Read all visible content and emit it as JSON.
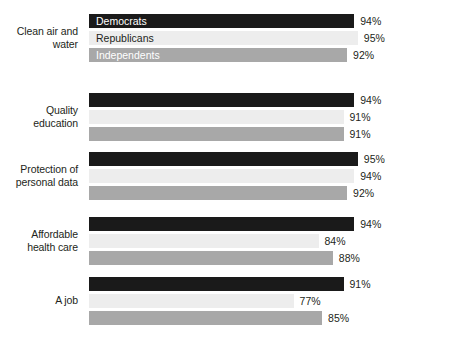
{
  "chart_data": {
    "type": "bar",
    "orientation": "horizontal",
    "title": "",
    "subtitle": "",
    "xlabel": "",
    "ylabel": "",
    "grid": false,
    "legend_position": "inside-first-group-bars",
    "value_suffix": "%",
    "axis_origin_percent": 62,
    "axis_max_percent": 100,
    "categories": [
      "Clean air and water",
      "Quality education",
      "Protection of personal data",
      "Affordable health care",
      "A job"
    ],
    "category_lines": [
      [
        "Clean air and",
        "water"
      ],
      [
        "Quality",
        "education"
      ],
      [
        "Protection of",
        "personal data"
      ],
      [
        "Affordable",
        "health care"
      ],
      [
        "A job"
      ]
    ],
    "series": [
      {
        "name": "Democrats",
        "color": "#1a1a1a",
        "values": [
          94,
          94,
          95,
          94,
          91
        ],
        "labels": [
          "94%",
          "94%",
          "95%",
          "94%",
          "91%"
        ]
      },
      {
        "name": "Republicans",
        "color": "#ededed",
        "values": [
          95,
          91,
          94,
          84,
          77
        ],
        "labels": [
          "95%",
          "91%",
          "94%",
          "84%",
          "77%"
        ]
      },
      {
        "name": "Independents",
        "color": "#a8a8a8",
        "values": [
          92,
          91,
          92,
          88,
          85
        ],
        "labels": [
          "92%",
          "91%",
          "92%",
          "88%",
          "85%"
        ]
      }
    ]
  },
  "legend": {
    "items": [
      {
        "label": "Democrats",
        "color": "#1a1a1a"
      },
      {
        "label": "Republicans",
        "color": "#ededed"
      },
      {
        "label": "Independents",
        "color": "#a8a8a8"
      }
    ]
  },
  "groups": [
    {
      "label_lines": [
        "Clean air and",
        "water"
      ],
      "bars": [
        {
          "series": "Democrats",
          "value": 94,
          "label": "94%"
        },
        {
          "series": "Republicans",
          "value": 95,
          "label": "95%"
        },
        {
          "series": "Independents",
          "value": 92,
          "label": "92%"
        }
      ]
    },
    {
      "label_lines": [
        "Quality",
        "education"
      ],
      "bars": [
        {
          "series": "Democrats",
          "value": 94,
          "label": "94%"
        },
        {
          "series": "Republicans",
          "value": 91,
          "label": "91%"
        },
        {
          "series": "Independents",
          "value": 91,
          "label": "91%"
        }
      ]
    },
    {
      "label_lines": [
        "Protection of",
        "personal data"
      ],
      "bars": [
        {
          "series": "Democrats",
          "value": 95,
          "label": "95%"
        },
        {
          "series": "Republicans",
          "value": 94,
          "label": "94%"
        },
        {
          "series": "Independents",
          "value": 92,
          "label": "92%"
        }
      ]
    },
    {
      "label_lines": [
        "Affordable",
        "health care"
      ],
      "bars": [
        {
          "series": "Democrats",
          "value": 94,
          "label": "94%"
        },
        {
          "series": "Republicans",
          "value": 84,
          "label": "84%"
        },
        {
          "series": "Independents",
          "value": 88,
          "label": "88%"
        }
      ]
    },
    {
      "label_lines": [
        "A job"
      ],
      "bars": [
        {
          "series": "Democrats",
          "value": 91,
          "label": "91%"
        },
        {
          "series": "Republicans",
          "value": 77,
          "label": "77%"
        },
        {
          "series": "Independents",
          "value": 85,
          "label": "85%"
        }
      ]
    }
  ]
}
